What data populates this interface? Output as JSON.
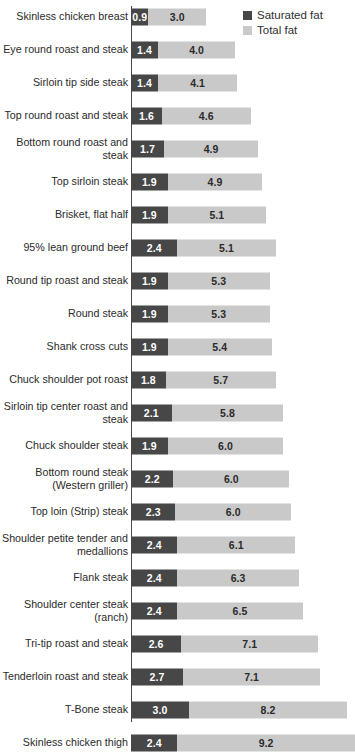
{
  "legend": {
    "position": "top-right",
    "items": [
      {
        "label": "Saturated fat",
        "color": "#474747",
        "icon": "square-swatch-icon"
      },
      {
        "label": "Total fat",
        "color": "#c9c9c9",
        "icon": "square-swatch-icon"
      }
    ]
  },
  "colors": {
    "saturated_fat": "#474747",
    "total_fat": "#c9c9c9",
    "axis": "#4a4a4a",
    "label_text": "#2b2b2b",
    "value_text_light": "#ffffff",
    "value_text_dark": "#2b2b2b"
  },
  "chart_data": {
    "type": "bar",
    "orientation": "horizontal",
    "stacked": true,
    "title": "",
    "subtitle": "",
    "xlabel": "",
    "ylabel": "",
    "grid": false,
    "legend_position": "top-right",
    "xlim": [
      0,
      10
    ],
    "px_per_unit": 19.3,
    "categories": [
      "Skinless chicken breast",
      "Eye round roast and steak",
      "Sirloin tip side steak",
      "Top round roast and steak",
      "Bottom round roast and steak",
      "Top sirloin steak",
      "Brisket, flat half",
      "95% lean ground beef",
      "Round tip roast and steak",
      "Round steak",
      "Shank cross cuts",
      "Chuck shoulder pot roast",
      "Sirloin tip center roast and steak",
      "Chuck shoulder steak",
      "Bottom round steak (Western griller)",
      "Top loin (Strip) steak",
      "Shoulder petite tender and medallions",
      "Flank steak",
      "Shoulder center steak (ranch)",
      "Tri-tip roast and steak",
      "Tenderloin roast and steak",
      "T-Bone steak",
      "Skinless chicken thigh"
    ],
    "series": [
      {
        "name": "Saturated fat",
        "color": "#474747",
        "values": [
          0.9,
          1.4,
          1.4,
          1.6,
          1.7,
          1.9,
          1.9,
          2.4,
          1.9,
          1.9,
          1.9,
          1.8,
          2.1,
          1.9,
          2.2,
          2.3,
          2.4,
          2.4,
          2.4,
          2.6,
          2.7,
          3.0,
          2.4
        ]
      },
      {
        "name": "Total fat",
        "color": "#c9c9c9",
        "values": [
          3.0,
          4.0,
          4.1,
          4.6,
          4.9,
          4.9,
          5.1,
          5.1,
          5.3,
          5.3,
          5.4,
          5.7,
          5.8,
          6.0,
          6.0,
          6.0,
          6.1,
          6.3,
          6.5,
          7.1,
          7.1,
          8.2,
          9.2
        ]
      }
    ],
    "value_labels": {
      "saturated": [
        "0.9",
        "1.4",
        "1.4",
        "1.6",
        "1.7",
        "1.9",
        "1.9",
        "2.4",
        "1.9",
        "1.9",
        "1.9",
        "1.8",
        "2.1",
        "1.9",
        "2.2",
        "2.3",
        "2.4",
        "2.4",
        "2.4",
        "2.6",
        "2.7",
        "3.0",
        "2.4"
      ],
      "total": [
        "3.0",
        "4.0",
        "4.1",
        "4.6",
        "4.9",
        "4.9",
        "5.1",
        "5.1",
        "5.3",
        "5.3",
        "5.4",
        "5.7",
        "5.8",
        "6.0",
        "6.0",
        "6.0",
        "6.1",
        "6.3",
        "6.5",
        "7.1",
        "7.1",
        "8.2",
        "9.2"
      ]
    }
  }
}
